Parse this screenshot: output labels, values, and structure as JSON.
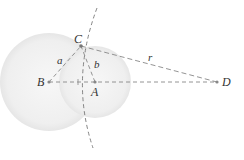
{
  "diagram": {
    "points": {
      "A": {
        "label": "A",
        "x": 95,
        "y": 82,
        "label_x": 92,
        "label_y": 95
      },
      "B": {
        "label": "B",
        "x": 49,
        "y": 82,
        "label_x": 38,
        "label_y": 86
      },
      "C": {
        "label": "C",
        "x": 81,
        "y": 46,
        "label_x": 74,
        "label_y": 43
      },
      "D": {
        "label": "D",
        "x": 217,
        "y": 82,
        "label_x": 222,
        "label_y": 86
      }
    },
    "segment_labels": {
      "a": {
        "label": "a",
        "x": 57,
        "y": 64
      },
      "b": {
        "label": "b",
        "x": 94,
        "y": 68
      },
      "r": {
        "label": "r",
        "x": 148,
        "y": 61
      }
    },
    "circles": [
      {
        "name": "circle-B",
        "cx": 49,
        "cy": 82,
        "r": 49
      },
      {
        "name": "circle-A",
        "cx": 95,
        "cy": 82,
        "r": 36
      }
    ],
    "colors": {
      "circle_fill": "#ececec",
      "line": "#777777",
      "point": "#888888"
    }
  }
}
